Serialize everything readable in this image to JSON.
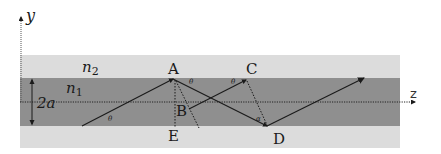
{
  "figure": {
    "colors": {
      "cladding": "#dcdcdc",
      "core": "#8f8f8f",
      "ray": "#1a1a1a",
      "dotted": "#222222",
      "background": "#ffffff"
    },
    "axes": {
      "y_label": "y",
      "z_label": "z"
    },
    "regions": {
      "cladding_label": "n",
      "cladding_sub": "2",
      "core_label": "n",
      "core_sub": "1",
      "thickness_label": "2a"
    },
    "points": {
      "A": "A",
      "B": "B",
      "C": "C",
      "D": "D",
      "E": "E"
    },
    "angles": {
      "theta": "θ",
      "alpha": "α"
    }
  }
}
